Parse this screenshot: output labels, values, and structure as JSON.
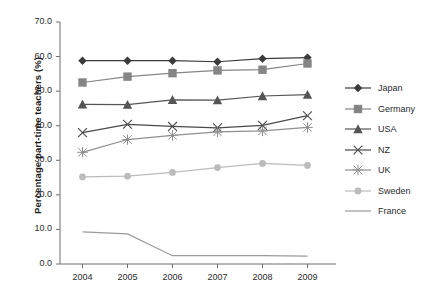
{
  "chart_data": {
    "type": "line",
    "title": "",
    "xlabel": "",
    "ylabel": "Percentage part-time teachers (%)",
    "categories": [
      "2004",
      "2005",
      "2006",
      "2007",
      "2008",
      "2009"
    ],
    "x": [
      2004,
      2005,
      2006,
      2007,
      2008,
      2009
    ],
    "ylim": [
      0.0,
      70.0
    ],
    "yticks": [
      "0.0",
      "10.0",
      "20.0",
      "30.0",
      "40.0",
      "50.0",
      "60.0",
      "70.0"
    ],
    "ytick_values": [
      0.0,
      10.0,
      20.0,
      30.0,
      40.0,
      50.0,
      60.0,
      70.0
    ],
    "grid": false,
    "legend_position": "right",
    "series": [
      {
        "name": "Japan",
        "marker": "diamond",
        "color": "#3b3b3b",
        "values": [
          58.8,
          58.8,
          58.8,
          58.5,
          59.4,
          59.7
        ]
      },
      {
        "name": "Germany",
        "marker": "square",
        "color": "#858585",
        "values": [
          52.5,
          54.2,
          55.2,
          56.0,
          56.2,
          58.0
        ]
      },
      {
        "name": "USA",
        "marker": "triangle",
        "color": "#555555",
        "values": [
          46.2,
          46.1,
          47.5,
          47.4,
          48.6,
          49.0
        ]
      },
      {
        "name": "NZ",
        "marker": "x",
        "color": "#4a4a4a",
        "values": [
          38.0,
          40.4,
          39.8,
          39.4,
          40.1,
          42.9
        ]
      },
      {
        "name": "UK",
        "marker": "asterisk",
        "color": "#8f8f8f",
        "values": [
          32.3,
          36.0,
          37.2,
          38.2,
          38.5,
          39.5
        ]
      },
      {
        "name": "Sweden",
        "marker": "circle",
        "color": "#bcbcbc",
        "values": [
          25.2,
          25.4,
          26.5,
          27.9,
          29.1,
          28.5
        ]
      },
      {
        "name": "France",
        "marker": "none",
        "color": "#9a9a9a",
        "values": [
          9.3,
          8.7,
          2.4,
          2.4,
          2.4,
          2.3
        ]
      }
    ]
  },
  "legend": {
    "items": [
      {
        "label": "Japan"
      },
      {
        "label": "Germany"
      },
      {
        "label": "USA"
      },
      {
        "label": "NZ"
      },
      {
        "label": "UK"
      },
      {
        "label": "Sweden"
      },
      {
        "label": "France"
      }
    ]
  },
  "axes": {
    "y_title": "Percentage part-time teachers (%)"
  }
}
